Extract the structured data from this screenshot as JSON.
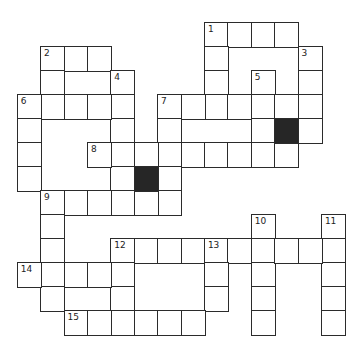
{
  "puzzle": {
    "type": "crossword",
    "cols": 14,
    "rows": 13,
    "origin": {
      "x": 16.7,
      "y": 22
    },
    "cell_size": {
      "w": 23.4,
      "h": 24
    },
    "colors": {
      "border": "#2b2b2b",
      "black_cell": "#262626",
      "white_cell": "#ffffff"
    },
    "entries": [
      {
        "number": "1",
        "direction": "across",
        "row": 0,
        "col": 8,
        "length": 4
      },
      {
        "number": "1",
        "direction": "down",
        "row": 0,
        "col": 8,
        "length": 4
      },
      {
        "number": "2",
        "direction": "across",
        "row": 1,
        "col": 1,
        "length": 3
      },
      {
        "number": "2",
        "direction": "down",
        "row": 1,
        "col": 1,
        "length": 3
      },
      {
        "number": "3",
        "direction": "down",
        "row": 1,
        "col": 12,
        "length": 4
      },
      {
        "number": "4",
        "direction": "down",
        "row": 2,
        "col": 4,
        "length": 6
      },
      {
        "number": "5",
        "direction": "down",
        "row": 2,
        "col": 10,
        "length": 4
      },
      {
        "number": "6",
        "direction": "across",
        "row": 3,
        "col": 0,
        "length": 5
      },
      {
        "number": "6",
        "direction": "down",
        "row": 3,
        "col": 0,
        "length": 4
      },
      {
        "number": "7",
        "direction": "across",
        "row": 3,
        "col": 6,
        "length": 7
      },
      {
        "number": "7",
        "direction": "down",
        "row": 3,
        "col": 6,
        "length": 5
      },
      {
        "number": "8",
        "direction": "across",
        "row": 5,
        "col": 3,
        "length": 9
      },
      {
        "number": "9",
        "direction": "across",
        "row": 7,
        "col": 1,
        "length": 6
      },
      {
        "number": "9",
        "direction": "down",
        "row": 7,
        "col": 1,
        "length": 5
      },
      {
        "number": "10",
        "direction": "down",
        "row": 8,
        "col": 10,
        "length": 5
      },
      {
        "number": "11",
        "direction": "down",
        "row": 8,
        "col": 13,
        "length": 5
      },
      {
        "number": "12",
        "direction": "across",
        "row": 9,
        "col": 4,
        "length": 10
      },
      {
        "number": "12",
        "direction": "down",
        "row": 9,
        "col": 4,
        "length": 4
      },
      {
        "number": "13",
        "direction": "down",
        "row": 9,
        "col": 8,
        "length": 3
      },
      {
        "number": "14",
        "direction": "across",
        "row": 10,
        "col": 0,
        "length": 5
      },
      {
        "number": "15",
        "direction": "across",
        "row": 12,
        "col": 2,
        "length": 6
      }
    ],
    "black_cells": [
      {
        "row": 4,
        "col": 11
      },
      {
        "row": 6,
        "col": 5
      }
    ]
  }
}
